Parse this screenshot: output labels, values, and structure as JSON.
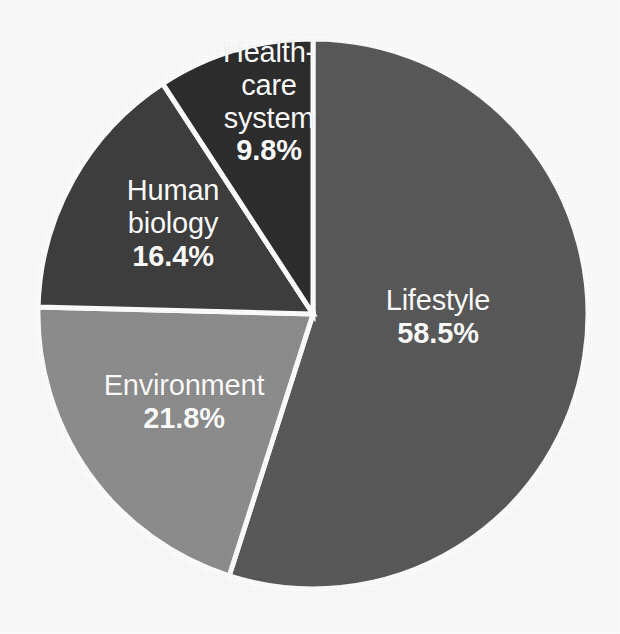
{
  "chart_data": {
    "type": "pie",
    "title": "",
    "subtitle": "",
    "xlabel": "",
    "ylabel": "",
    "legend_position": "none",
    "grid": false,
    "labels_inside": true,
    "start_angle_deg": 0,
    "direction": "clockwise",
    "categories": [
      "Lifestyle",
      "Environment",
      "Human biology",
      "Healthcare system"
    ],
    "values": [
      58.5,
      21.8,
      16.4,
      9.8
    ],
    "value_suffix": "%",
    "slices": [
      {
        "name": "Lifestyle",
        "label_line1": "Lifestyle",
        "label_line2": "",
        "label_line3": "",
        "value_text": "58.5%",
        "value": 58.5,
        "color": "#5a5a5a",
        "angle_deg": 210.6
      },
      {
        "name": "Environment",
        "label_line1": "Environment",
        "label_line2": "",
        "label_line3": "",
        "value_text": "21.8%",
        "value": 21.8,
        "color": "#8e8e8e",
        "angle_deg": 78.5
      },
      {
        "name": "Human biology",
        "label_line1": "Human",
        "label_line2": "biology",
        "label_line3": "",
        "value_text": "16.4%",
        "value": 16.4,
        "color": "#3f3f3f",
        "angle_deg": 59.0
      },
      {
        "name": "Healthcare system",
        "label_line1": "Health-",
        "label_line2": "care",
        "label_line3": "system",
        "value_text": "9.8%",
        "value": 9.8,
        "color": "#2e2e2e",
        "angle_deg": 35.3
      }
    ],
    "separator_color": "#ffffff",
    "label_text_color": "#ffffff",
    "background_color": "#fdfdfd"
  },
  "geometry": {
    "center_x": 313,
    "center_y": 314,
    "radius": 275
  }
}
